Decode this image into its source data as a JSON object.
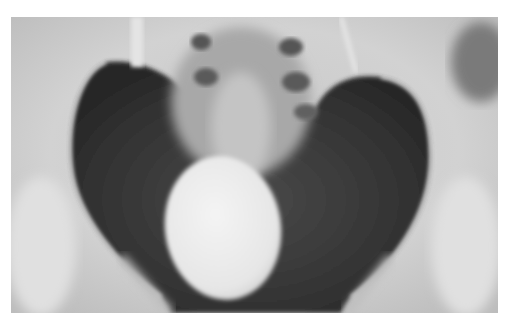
{
  "image": {
    "subject": "pelvic x-ray with contrast-filled bladder",
    "canvas": {
      "width": 507,
      "height": 320,
      "background": "#ffffff"
    },
    "frame": {
      "x": 11,
      "y": 17,
      "width": 487,
      "height": 296
    },
    "colors": {
      "bone_light": "#d8d8d8",
      "bone_mid": "#bdbdbd",
      "pelvic_cavity": "#3c3c3c",
      "pelvic_cavity_dark": "#2a2a2a",
      "bladder": "#ececec",
      "sacrum_shadow": "#6a6a6a"
    }
  }
}
